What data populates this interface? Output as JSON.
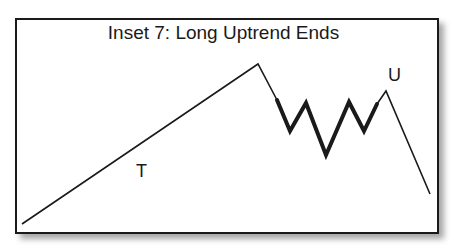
{
  "title": "Inset 7: Long Uptrend Ends",
  "labels": {
    "trend": "T",
    "upthrust": "U"
  },
  "colors": {
    "line": "#1a1a1a",
    "frame": "#1a1a1a",
    "background": "#ffffff"
  }
}
